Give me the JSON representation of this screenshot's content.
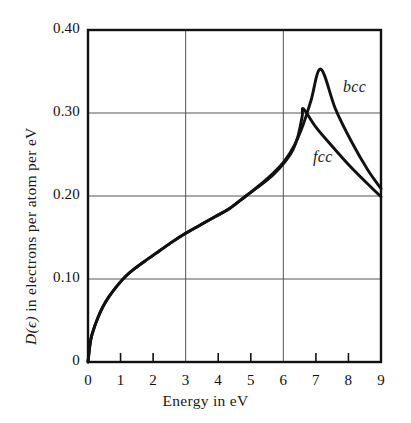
{
  "figure": {
    "background": "#ffffff",
    "ink_color": "#111111",
    "grid_color": "#555555"
  },
  "axes": {
    "x_title": "Energy in eV",
    "y_title_symbol": "D(ϵ)",
    "y_title_rest": " in electrons per atom per eV",
    "y_title_full": "D(ϵ) in electrons per atom per eV",
    "x_ticks": [
      "0",
      "1",
      "2",
      "3",
      "4",
      "5",
      "6",
      "7",
      "8",
      "9"
    ],
    "y_ticks": [
      "0",
      "0.10",
      "0.20",
      "0.30",
      "0.40"
    ]
  },
  "labels": {
    "bcc": "bcc",
    "fcc": "fcc"
  },
  "chart_data": {
    "type": "line",
    "title": "",
    "xlabel": "Energy in eV",
    "ylabel": "D(ϵ) in electrons per atom per eV",
    "xlim": [
      0,
      9
    ],
    "ylim": [
      0,
      0.4
    ],
    "xticks": [
      0,
      1,
      2,
      3,
      4,
      5,
      6,
      7,
      8,
      9
    ],
    "yticks": [
      0,
      0.1,
      0.2,
      0.3,
      0.4
    ],
    "grid": {
      "enabled": true,
      "x_gridlines": [
        3,
        6
      ],
      "y_gridlines": [
        0.1,
        0.2,
        0.3
      ]
    },
    "legend": {
      "position": "inline-annotation",
      "entries": [
        "bcc",
        "fcc"
      ]
    },
    "annotations": [
      {
        "text": "bcc",
        "x": 7.9,
        "y": 0.343,
        "style": "italic"
      },
      {
        "text": "fcc",
        "x": 7.0,
        "y": 0.258,
        "style": "italic"
      }
    ],
    "series": [
      {
        "name": "fcc",
        "x": [
          0.0,
          0.08,
          0.18,
          0.3,
          0.45,
          0.65,
          0.9,
          1.15,
          1.45,
          1.8,
          2.2,
          2.6,
          3.0,
          3.45,
          3.9,
          4.35,
          4.85,
          5.3,
          5.7,
          6.05,
          6.3,
          6.45,
          6.58,
          6.62,
          7.0,
          7.5,
          8.0,
          8.5,
          9.0
        ],
        "y": [
          0.0,
          0.026,
          0.04,
          0.053,
          0.066,
          0.079,
          0.092,
          0.103,
          0.113,
          0.123,
          0.134,
          0.145,
          0.155,
          0.165,
          0.175,
          0.185,
          0.2,
          0.213,
          0.226,
          0.241,
          0.256,
          0.272,
          0.296,
          0.305,
          0.283,
          0.26,
          0.238,
          0.218,
          0.199
        ]
      },
      {
        "name": "bcc",
        "x": [
          0.0,
          0.08,
          0.18,
          0.3,
          0.45,
          0.65,
          0.9,
          1.15,
          1.45,
          1.8,
          2.2,
          2.6,
          3.0,
          3.45,
          3.9,
          4.35,
          4.85,
          5.3,
          5.7,
          6.05,
          6.35,
          6.6,
          6.85,
          7.15,
          7.6,
          8.1,
          8.6,
          9.0
        ],
        "y": [
          0.0,
          0.026,
          0.04,
          0.053,
          0.066,
          0.079,
          0.092,
          0.103,
          0.113,
          0.123,
          0.134,
          0.145,
          0.155,
          0.165,
          0.175,
          0.185,
          0.2,
          0.214,
          0.228,
          0.243,
          0.262,
          0.285,
          0.315,
          0.353,
          0.305,
          0.265,
          0.231,
          0.209
        ]
      }
    ]
  }
}
